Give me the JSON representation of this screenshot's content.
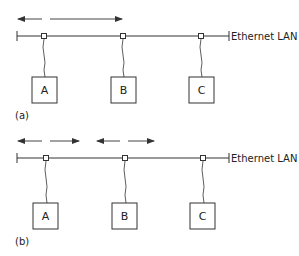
{
  "figure": {
    "panels": [
      {
        "id": "a",
        "label": "(a)",
        "lan_label": "Ethernet LAN",
        "stations": [
          {
            "name": "A"
          },
          {
            "name": "B"
          },
          {
            "name": "C"
          }
        ],
        "signal_arrows": "Single transmission from A spreading both directions along the cable"
      },
      {
        "id": "b",
        "label": "(b)",
        "lan_label": "Ethernet LAN",
        "stations": [
          {
            "name": "A"
          },
          {
            "name": "B"
          },
          {
            "name": "C"
          }
        ],
        "signal_arrows": "Simultaneous transmissions from A and B spreading both directions (collision)"
      }
    ],
    "colors": {
      "line": "#333333",
      "background": "#ffffff"
    }
  }
}
